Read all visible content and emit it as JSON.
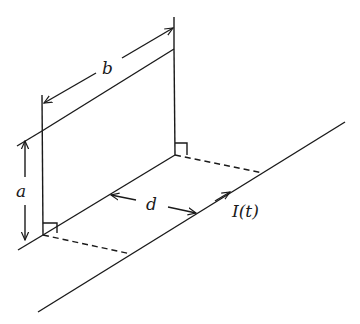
{
  "diagram": {
    "labels": {
      "b": "b",
      "a": "a",
      "d": "d",
      "current": "I(t)"
    },
    "colors": {
      "line": "#1a1a1a",
      "background": "#ffffff"
    }
  }
}
